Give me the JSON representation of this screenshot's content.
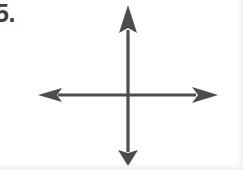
{
  "worksheet": {
    "problem_number": "5.",
    "figure_label": "perpendicular-axes-cross"
  },
  "figure": {
    "stroke_color": "#4d4d4d",
    "background_color": "#ffffff",
    "center": {
      "x": 128,
      "y": 95
    },
    "vertical_axis": {
      "name": "vertical-double-arrow",
      "x": 128,
      "top_tip_y": 5,
      "bottom_tip_y": 166,
      "shaft_width": 3
    },
    "horizontal_axis": {
      "name": "horizontal-double-arrow",
      "y": 95,
      "left_tip_x": 38,
      "right_tip_x": 218,
      "shaft_width": 3
    },
    "arrowheads": {
      "up": {
        "width": 18,
        "length": 28
      },
      "down": {
        "width": 20,
        "length": 16
      },
      "left": {
        "width": 14,
        "length": 24
      },
      "right": {
        "width": 16,
        "length": 26
      }
    }
  }
}
